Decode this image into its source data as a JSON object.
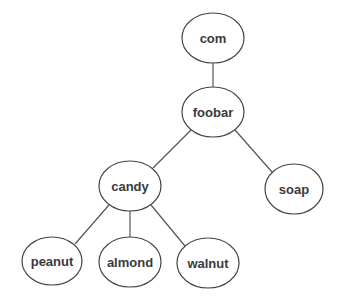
{
  "diagram": {
    "type": "tree",
    "nodes": [
      {
        "id": "com",
        "label": "com",
        "cx": 213,
        "cy": 38,
        "rx": 31,
        "ry": 25
      },
      {
        "id": "foobar",
        "label": "foobar",
        "cx": 213,
        "cy": 112,
        "rx": 31,
        "ry": 25
      },
      {
        "id": "candy",
        "label": "candy",
        "cx": 130,
        "cy": 186,
        "rx": 31,
        "ry": 25
      },
      {
        "id": "soap",
        "label": "soap",
        "cx": 294,
        "cy": 189,
        "rx": 29,
        "ry": 25
      },
      {
        "id": "peanut",
        "label": "peanut",
        "cx": 52,
        "cy": 261,
        "rx": 30,
        "ry": 24
      },
      {
        "id": "almond",
        "label": "almond",
        "cx": 130,
        "cy": 262,
        "rx": 31,
        "ry": 25
      },
      {
        "id": "walnut",
        "label": "walnut",
        "cx": 208,
        "cy": 263,
        "rx": 31,
        "ry": 25
      }
    ],
    "edges": [
      {
        "from": "com",
        "to": "foobar"
      },
      {
        "from": "foobar",
        "to": "candy"
      },
      {
        "from": "foobar",
        "to": "soap"
      },
      {
        "from": "candy",
        "to": "peanut"
      },
      {
        "from": "candy",
        "to": "almond"
      },
      {
        "from": "candy",
        "to": "walnut"
      }
    ]
  }
}
